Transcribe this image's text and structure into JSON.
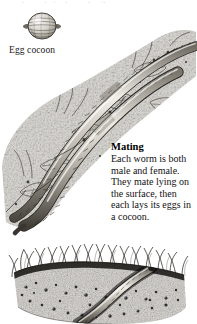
{
  "page": {
    "top_clipped_line": "beneath, in the cool soil",
    "background": "#ffffff",
    "ink": "#141414"
  },
  "figures": {
    "egg_cocoon": {
      "name": "egg-cocoon",
      "caption": "Egg cocoon",
      "description": "lemon-shaped cocoon with horizontal banding and tapered ends"
    },
    "mating": {
      "name": "mating-worms",
      "description": "two earthworms lying together diagonally on leaf litter and soil debris"
    },
    "soil_section": {
      "name": "soil-cross-section",
      "description": "cutaway of grassy turf with an earthworm burrowing through stippled soil"
    }
  },
  "text": {
    "heading": "Mating",
    "body": "Each worm is both male and female. They mate lying on the surface, then each lays its eggs in a cocoon."
  }
}
